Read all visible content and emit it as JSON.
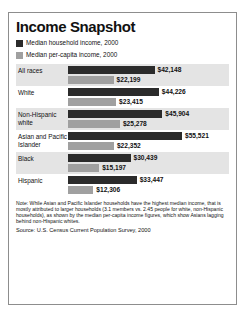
{
  "chart_data": {
    "type": "bar",
    "title": "Income Snapshot",
    "xlabel": "",
    "ylabel": "",
    "orientation": "horizontal",
    "grid": false,
    "legend_position": "top-left",
    "xlim": [
      0,
      55521
    ],
    "categories": [
      "All races",
      "White",
      "Non-Hispanic white",
      "Asian and Pacific Islander",
      "Black",
      "Hispanic"
    ],
    "series": [
      {
        "name": "Median household income, 2000",
        "color": "#2b2b2b",
        "values": [
          42148,
          44226,
          45904,
          55521,
          30439,
          33447
        ],
        "labels": [
          "$42,148",
          "$44,226",
          "$45,904",
          "$55,521",
          "$30,439",
          "$33,447"
        ]
      },
      {
        "name": "Median per-capita income, 2000",
        "color": "#a0a0a0",
        "values": [
          22199,
          23415,
          25278,
          22352,
          15197,
          12306
        ],
        "labels": [
          "$22,199",
          "$23,415",
          "$25,278",
          "$22,352",
          "$15,197",
          "$12,306"
        ]
      }
    ],
    "note": "Note: While Asian and Pacific Islander households have the highest median income, that is mostly attributed to larger households (3.1 members vs. 2.45 people for white, non-Hispanic households), as shown by the median per-capita income figures, which show Asians lagging behind non-Hispanic whites.",
    "source": "Source: U.S. Census Current Population Survey, 2000"
  },
  "legend": {
    "items": [
      {
        "label": "Median household income, 2000",
        "swatch": "dark-swatch"
      },
      {
        "label": "Median per-capita income, 2000",
        "swatch": "light-swatch"
      }
    ]
  },
  "rows": [
    {
      "label": "All races",
      "household": {
        "label": "$42,148",
        "value": 42148
      },
      "percapita": {
        "label": "$22,199",
        "value": 22199
      }
    },
    {
      "label": "White",
      "household": {
        "label": "$44,226",
        "value": 44226
      },
      "percapita": {
        "label": "$23,415",
        "value": 23415
      }
    },
    {
      "label": "Non-Hispanic white",
      "household": {
        "label": "$45,904",
        "value": 45904
      },
      "percapita": {
        "label": "$25,278",
        "value": 25278
      }
    },
    {
      "label": "Asian and Pacific Islander",
      "household": {
        "label": "$55,521",
        "value": 55521
      },
      "percapita": {
        "label": "$22,352",
        "value": 22352
      }
    },
    {
      "label": "Black",
      "household": {
        "label": "$30,439",
        "value": 30439
      },
      "percapita": {
        "label": "$15,197",
        "value": 15197
      }
    },
    {
      "label": "Hispanic",
      "household": {
        "label": "$33,447",
        "value": 33447
      },
      "percapita": {
        "label": "$12,306",
        "value": 12306
      }
    }
  ]
}
